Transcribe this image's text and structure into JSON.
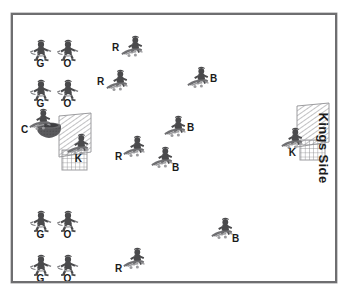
{
  "diagram": {
    "side_label": "Kings Side",
    "frame_color": "#6e6e70",
    "background": "#ffffff",
    "label_color": "#1a1a1a"
  },
  "legend_codes": [
    "G",
    "O",
    "C",
    "K",
    "R",
    "B"
  ],
  "units": [
    {
      "id": "u1",
      "code": "G",
      "x": 28,
      "y": 35,
      "tag": "below",
      "pose": "runner"
    },
    {
      "id": "u2",
      "code": "O",
      "x": 55,
      "y": 35,
      "tag": "below",
      "pose": "runner"
    },
    {
      "id": "u3",
      "code": "G",
      "x": 28,
      "y": 75,
      "tag": "below",
      "pose": "runner"
    },
    {
      "id": "u4",
      "code": "O",
      "x": 55,
      "y": 75,
      "tag": "below",
      "pose": "runner"
    },
    {
      "id": "u5",
      "code": "C",
      "x": 28,
      "y": 105,
      "tag": "bl",
      "pose": "rider"
    },
    {
      "id": "u6",
      "code": "K",
      "x": 66,
      "y": 130,
      "tag": "below",
      "pose": "rider"
    },
    {
      "id": "u7",
      "code": "R",
      "x": 120,
      "y": 32,
      "tag": "left",
      "pose": "rider"
    },
    {
      "id": "u8",
      "code": "R",
      "x": 105,
      "y": 66,
      "tag": "left",
      "pose": "rider"
    },
    {
      "id": "u9",
      "code": "B",
      "x": 186,
      "y": 63,
      "tag": "right",
      "pose": "rider"
    },
    {
      "id": "u10",
      "code": "B",
      "x": 163,
      "y": 112,
      "tag": "right",
      "pose": "rider"
    },
    {
      "id": "u11",
      "code": "R",
      "x": 122,
      "y": 132,
      "tag": "bl",
      "pose": "rider"
    },
    {
      "id": "u12",
      "code": "B",
      "x": 150,
      "y": 143,
      "tag": "br",
      "pose": "rider"
    },
    {
      "id": "u13",
      "code": "K",
      "x": 280,
      "y": 124,
      "tag": "below",
      "pose": "rider"
    },
    {
      "id": "u14",
      "code": "G",
      "x": 28,
      "y": 206,
      "tag": "below",
      "pose": "runner"
    },
    {
      "id": "u15",
      "code": "O",
      "x": 55,
      "y": 206,
      "tag": "below",
      "pose": "runner"
    },
    {
      "id": "u16",
      "code": "G",
      "x": 28,
      "y": 250,
      "tag": "below",
      "pose": "runner"
    },
    {
      "id": "u17",
      "code": "O",
      "x": 55,
      "y": 250,
      "tag": "below",
      "pose": "runner"
    },
    {
      "id": "u18",
      "code": "R",
      "x": 122,
      "y": 244,
      "tag": "bl",
      "pose": "rider"
    },
    {
      "id": "u19",
      "code": "B",
      "x": 210,
      "y": 214,
      "tag": "br",
      "pose": "rider"
    }
  ],
  "goals": [
    {
      "id": "goal-left",
      "x": 60,
      "y": 128,
      "w": 46,
      "h": 62
    },
    {
      "id": "goal-right",
      "x": 298,
      "y": 118,
      "w": 46,
      "h": 62
    }
  ],
  "props": [
    {
      "id": "cauldron",
      "x": 36,
      "y": 114,
      "w": 30,
      "h": 22
    }
  ]
}
